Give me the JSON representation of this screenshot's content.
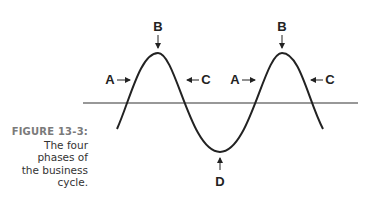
{
  "caption": {
    "figure_label": "FIGURE 13-3:",
    "text_lines": [
      "The four",
      "phases of",
      "the business",
      "cycle."
    ]
  },
  "diagram": {
    "type": "sine-wave business cycle",
    "labels": {
      "expansion": "A",
      "peak": "B",
      "contraction": "C",
      "trough": "D"
    },
    "annotations": [
      {
        "label": "A",
        "position": "left of first rise",
        "arrow": "right"
      },
      {
        "label": "B",
        "position": "above first peak",
        "arrow": "down"
      },
      {
        "label": "C",
        "position": "right of first fall",
        "arrow": "left"
      },
      {
        "label": "D",
        "position": "below trough",
        "arrow": "up"
      },
      {
        "label": "A",
        "position": "left of second rise",
        "arrow": "right"
      },
      {
        "label": "B",
        "position": "above second peak",
        "arrow": "down"
      },
      {
        "label": "C",
        "position": "right of second fall",
        "arrow": "left"
      }
    ],
    "colors": {
      "line": "#222222",
      "baseline": "#333333",
      "caption_label": "#7a7a7a"
    }
  }
}
